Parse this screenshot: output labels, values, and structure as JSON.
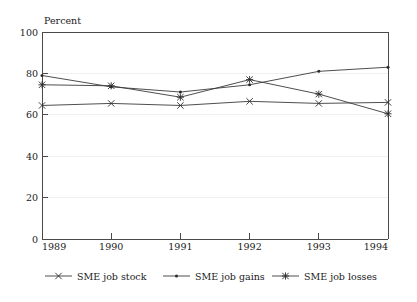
{
  "chart_data": {
    "type": "line",
    "title": "",
    "subtitle": "",
    "axis_title": "Percent",
    "xlabel": "",
    "ylabel": "Percent",
    "x": [
      "1989",
      "1990",
      "1991",
      "1992",
      "1993",
      "1994"
    ],
    "categories": [
      "1989",
      "1990",
      "1991",
      "1992",
      "1993",
      "1994"
    ],
    "xtick_labels": [
      "1989",
      "1990",
      "1991",
      "1992",
      "1993",
      "1994"
    ],
    "ytick_labels": [
      "0",
      "20",
      "40",
      "60",
      "80",
      "100"
    ],
    "yticks": [
      0,
      20,
      40,
      60,
      80,
      100
    ],
    "ylim": [
      0,
      100
    ],
    "grid": "horizontal-faint",
    "legend_position": "bottom",
    "series": [
      {
        "name": "SME job stock",
        "marker": "x-cross",
        "color": "#3a3a3a",
        "values": [
          64.5,
          65.5,
          64.5,
          66.5,
          65.5,
          66.0
        ]
      },
      {
        "name": "SME job gains",
        "marker": "dot",
        "color": "#3a3a3a",
        "values": [
          79.0,
          73.5,
          71.0,
          74.5,
          81.0,
          83.0
        ]
      },
      {
        "name": "SME job losses",
        "marker": "asterisk",
        "color": "#3a3a3a",
        "values": [
          74.5,
          74.0,
          68.5,
          77.0,
          70.0,
          60.5
        ]
      }
    ]
  },
  "legend": {
    "items": [
      {
        "label": "SME job stock"
      },
      {
        "label": "SME job gains"
      },
      {
        "label": "SME job losses"
      }
    ]
  },
  "colors": {
    "axis": "#4a4a4a",
    "grid": "#f0f0f0",
    "ink": "#2b2b2b",
    "background": "#ffffff"
  }
}
